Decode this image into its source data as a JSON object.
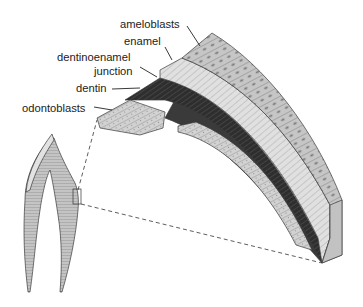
{
  "figure": {
    "labels": [
      {
        "id": "ameloblasts",
        "text": "ameloblasts"
      },
      {
        "id": "enamel",
        "text": "enamel"
      },
      {
        "id": "dentinoenamel",
        "text": "dentinoenamel"
      },
      {
        "id": "junction",
        "text": "junction"
      },
      {
        "id": "dentin",
        "text": "dentin"
      },
      {
        "id": "odontoblasts",
        "text": "odontoblasts"
      }
    ],
    "layers": [
      {
        "name": "ameloblasts",
        "color": "#c9c9c9"
      },
      {
        "name": "enamel",
        "color": "#dcdcdc"
      },
      {
        "name": "dentin",
        "color": "#3a3a3a"
      },
      {
        "name": "odontoblasts",
        "color": "#cfcfcf"
      }
    ],
    "inset": {
      "name": "tooth cross-section",
      "color": "#bfbfbf"
    }
  }
}
